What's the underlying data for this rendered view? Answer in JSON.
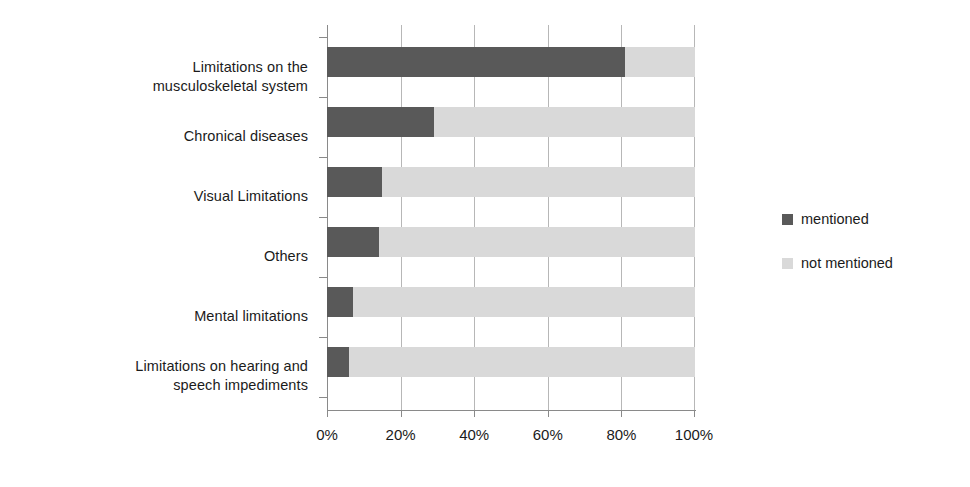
{
  "chart_data": {
    "type": "bar",
    "orientation": "horizontal",
    "stacked": true,
    "stack_mode": "percent",
    "title": "",
    "subtitle": "",
    "xlabel": "",
    "ylabel": "",
    "xlim": [
      0,
      100
    ],
    "grid": true,
    "grid_axis": "x",
    "legend_position": "right",
    "categories": [
      "Limitations on the musculoskeletal system",
      "Chronical diseases",
      "Visual Limitations",
      "Others",
      "Mental limitations",
      "Limitations on hearing and speech impediments"
    ],
    "category_labels": [
      [
        "Limitations on the",
        "musculoskeletal system"
      ],
      [
        "Chronical diseases"
      ],
      [
        "Visual Limitations"
      ],
      [
        "Others"
      ],
      [
        "Mental limitations"
      ],
      [
        "Limitations on hearing and",
        "speech impediments"
      ]
    ],
    "series": [
      {
        "name": "mentioned",
        "color": "#595959",
        "values": [
          81,
          29,
          15,
          14,
          7,
          6
        ]
      },
      {
        "name": "not mentioned",
        "color": "#d9d9d9",
        "values": [
          19,
          71,
          85,
          86,
          93,
          94
        ]
      }
    ],
    "xticks": [
      0,
      20,
      40,
      60,
      80,
      100
    ],
    "xticklabels": [
      "0%",
      "20%",
      "40%",
      "60%",
      "80%",
      "100%"
    ]
  },
  "legend": {
    "items": [
      {
        "label": "mentioned",
        "color": "#595959"
      },
      {
        "label": "not mentioned",
        "color": "#d9d9d9"
      }
    ]
  }
}
